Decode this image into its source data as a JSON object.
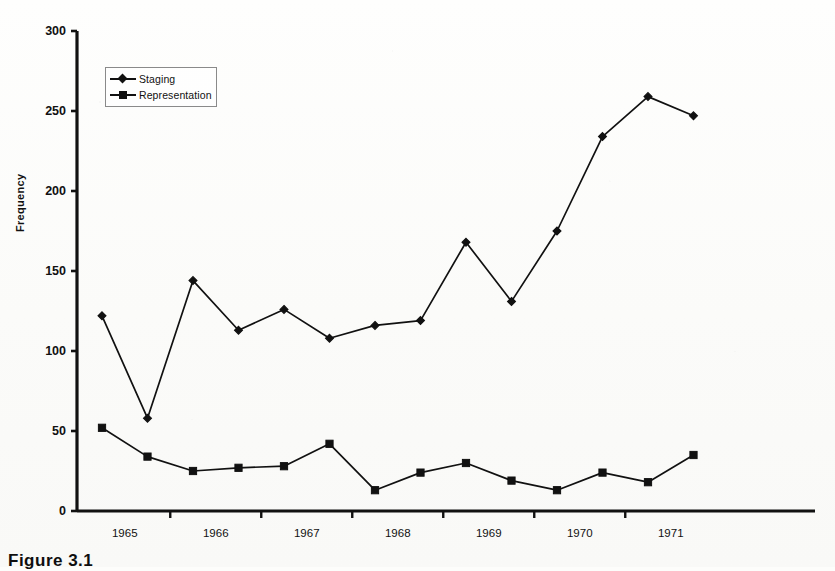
{
  "figure": {
    "caption": "Figure 3.1",
    "ylabel": "Frequency"
  },
  "legend": {
    "position": "top-left-inside",
    "entries": [
      {
        "label": "Staging",
        "marker": "diamond-marker",
        "color": "#111111"
      },
      {
        "label": "Representation",
        "marker": "square-marker",
        "color": "#111111"
      }
    ]
  },
  "axes": {
    "y_ticks": [
      "0",
      "50",
      "100",
      "150",
      "200",
      "250",
      "300"
    ],
    "x_ticks": [
      "1965",
      "1966",
      "1967",
      "1968",
      "1969",
      "1970",
      "1971"
    ]
  },
  "chart_data": {
    "type": "line",
    "title": "",
    "subtitle": "",
    "xlabel": "",
    "ylabel": "Frequency",
    "xlim": [
      0,
      13
    ],
    "ylim": [
      0,
      300
    ],
    "yticks": [
      0,
      50,
      100,
      150,
      200,
      250,
      300
    ],
    "grid": false,
    "legend_position": "upper left",
    "x": [
      "1965",
      "1965.5",
      "1966",
      "1966.5",
      "1967",
      "1967.5",
      "1968",
      "1968.5",
      "1969",
      "1969.5",
      "1970",
      "1970.5",
      "1971",
      "1971.5"
    ],
    "xtick_labels": [
      "1965",
      "1966",
      "1967",
      "1968",
      "1969",
      "1970",
      "1971"
    ],
    "series": [
      {
        "name": "Staging",
        "marker": "diamond",
        "color": "#111111",
        "values": [
          122,
          58,
          144,
          113,
          126,
          108,
          116,
          119,
          168,
          131,
          175,
          234,
          259,
          247
        ]
      },
      {
        "name": "Representation",
        "marker": "square",
        "color": "#111111",
        "values": [
          52,
          34,
          25,
          27,
          28,
          42,
          13,
          24,
          30,
          19,
          13,
          24,
          18,
          35
        ]
      }
    ]
  }
}
